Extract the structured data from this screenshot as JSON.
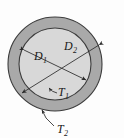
{
  "figure": {
    "kind": "annulus-cross-section-diagram",
    "background_color": "#fdfdfd"
  },
  "geometry": {
    "center_x": 55,
    "center_y": 64,
    "outer_radius": 47,
    "inner_radius": 36,
    "ring_thickness": 11
  },
  "colors": {
    "outer_ring_fill": "#a9a9a9",
    "inner_disc_fill": "#d8d8d8",
    "stroke": "#3c3c3c",
    "label_color": "#1a1a1a",
    "leader_color": "#2b2b2b"
  },
  "labels": {
    "inner_diameter": {
      "base": "D",
      "sub": "1",
      "text": "D1",
      "x": 34,
      "y": 60
    },
    "outer_diameter": {
      "base": "D",
      "sub": "2",
      "text": "D2",
      "x": 64,
      "y": 50
    },
    "inner_thickness": {
      "base": "T",
      "sub": "1",
      "text": "T1",
      "x": 58,
      "y": 96
    },
    "outer_thickness": {
      "base": "T",
      "sub": "2",
      "text": "T2",
      "x": 57,
      "y": 133
    }
  },
  "dimension_lines": {
    "inner_diameter_line": {
      "name": "D1",
      "from_x": 24,
      "from_y": 50,
      "to_x": 86,
      "to_y": 80,
      "arrowheads": "both"
    },
    "outer_diameter_line": {
      "name": "D2",
      "from_x": 99,
      "from_y": 45,
      "to_x": 22,
      "to_y": 93,
      "arrowheads": "both"
    }
  },
  "leader_lines": {
    "inner_thickness_leader": {
      "name": "T1",
      "tip_x": 49,
      "tip_y": 88,
      "tail_x": 57,
      "tail_y": 93
    },
    "outer_thickness_leader": {
      "name": "T2",
      "tip_x": 42,
      "tip_y": 110,
      "tail_x": 54,
      "tail_y": 126
    }
  }
}
